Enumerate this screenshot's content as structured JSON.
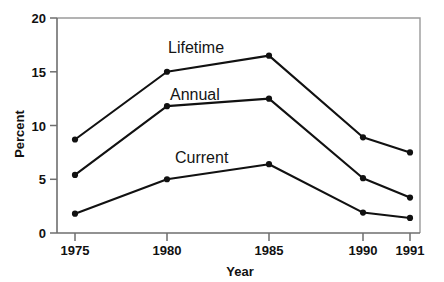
{
  "chart_data": {
    "type": "line",
    "title": "",
    "xlabel": "Year",
    "ylabel": "Percent",
    "categories": [
      "1975",
      "1980",
      "1985",
      "1990",
      "1991"
    ],
    "x": [
      1975,
      1980,
      1985,
      1990,
      1991
    ],
    "xtick_labels": [
      "1975",
      "1980",
      "1985",
      "1990",
      "1991"
    ],
    "ytick_labels": [
      "0",
      "5",
      "10",
      "15",
      "20"
    ],
    "yticks": [
      0,
      5,
      10,
      15,
      20
    ],
    "ylim": [
      0,
      20
    ],
    "grid": false,
    "legend_position": "inline-labels",
    "series": [
      {
        "name": "Lifetime",
        "values": [
          8.7,
          15.0,
          16.5,
          8.9,
          7.5
        ],
        "label": "Lifetime"
      },
      {
        "name": "Annual",
        "values": [
          5.4,
          11.8,
          12.5,
          5.1,
          3.3
        ],
        "label": "Annual"
      },
      {
        "name": "Current",
        "values": [
          1.8,
          5.0,
          6.4,
          1.9,
          1.4
        ],
        "label": "Current"
      }
    ],
    "annotations": [
      {
        "text": "Lifetime",
        "x_px": 168,
        "y_px": 53
      },
      {
        "text": "Annual",
        "x_px": 170,
        "y_px": 100
      },
      {
        "text": "Current",
        "x_px": 175,
        "y_px": 163
      }
    ],
    "colors": {
      "line": "#111111",
      "marker": "#111111",
      "axis": "#6e6e6e",
      "frame": "#9a9a9a",
      "text": "#111111",
      "background": "#ffffff"
    }
  },
  "axes": {
    "y_title": "Percent",
    "x_title": "Year"
  }
}
